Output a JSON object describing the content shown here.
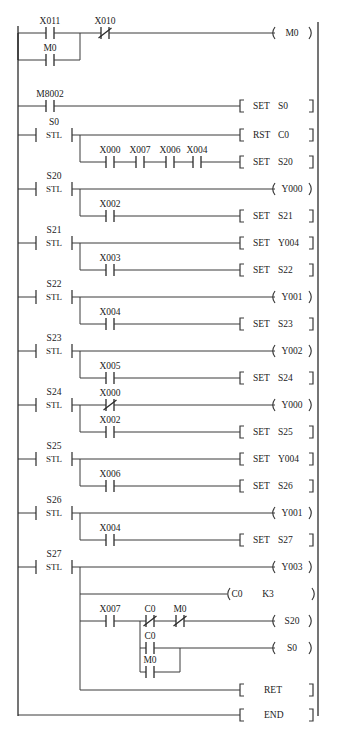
{
  "diagram": {
    "type": "ladder-diagram",
    "left_rail_x": 18,
    "right_rail_x": 318,
    "instructions": {
      "stl": "STL",
      "set": "SET",
      "rst": "RST",
      "ret": "RET",
      "end": "END"
    },
    "rungs": [
      {
        "id": "rung-1",
        "step": null,
        "contacts": [
          {
            "name": "X011",
            "type": "no"
          },
          {
            "name": "M0",
            "type": "no",
            "branch": "parallel"
          },
          {
            "name": "X010",
            "type": "nc"
          }
        ],
        "output": {
          "kind": "coil",
          "label": "M0"
        }
      },
      {
        "id": "rung-2",
        "step": null,
        "contacts": [
          {
            "name": "M8002",
            "type": "no"
          }
        ],
        "output": {
          "kind": "box",
          "instruction": "SET",
          "operand": "S0"
        }
      },
      {
        "id": "rung-3",
        "step": "S0",
        "lines": [
          {
            "contacts": [],
            "output": {
              "kind": "box",
              "instruction": "RST",
              "operand": "C0"
            }
          },
          {
            "contacts": [
              {
                "name": "X000",
                "type": "no"
              },
              {
                "name": "X007",
                "type": "no"
              },
              {
                "name": "X006",
                "type": "no"
              },
              {
                "name": "X004",
                "type": "no"
              }
            ],
            "output": {
              "kind": "box",
              "instruction": "SET",
              "operand": "S20"
            }
          }
        ]
      },
      {
        "id": "rung-4",
        "step": "S20",
        "lines": [
          {
            "contacts": [],
            "output": {
              "kind": "coil",
              "label": "Y000"
            }
          },
          {
            "contacts": [
              {
                "name": "X002",
                "type": "no"
              }
            ],
            "output": {
              "kind": "box",
              "instruction": "SET",
              "operand": "S21"
            }
          }
        ]
      },
      {
        "id": "rung-5",
        "step": "S21",
        "lines": [
          {
            "contacts": [],
            "output": {
              "kind": "box",
              "instruction": "SET",
              "operand": "Y004"
            }
          },
          {
            "contacts": [
              {
                "name": "X003",
                "type": "no"
              }
            ],
            "output": {
              "kind": "box",
              "instruction": "SET",
              "operand": "S22"
            }
          }
        ]
      },
      {
        "id": "rung-6",
        "step": "S22",
        "lines": [
          {
            "contacts": [],
            "output": {
              "kind": "coil",
              "label": "Y001"
            }
          },
          {
            "contacts": [
              {
                "name": "X004",
                "type": "no"
              }
            ],
            "output": {
              "kind": "box",
              "instruction": "SET",
              "operand": "S23"
            }
          }
        ]
      },
      {
        "id": "rung-7",
        "step": "S23",
        "lines": [
          {
            "contacts": [],
            "output": {
              "kind": "coil",
              "label": "Y002"
            }
          },
          {
            "contacts": [
              {
                "name": "X005",
                "type": "no"
              }
            ],
            "output": {
              "kind": "box",
              "instruction": "SET",
              "operand": "S24"
            }
          }
        ]
      },
      {
        "id": "rung-8",
        "step": "S24",
        "lines": [
          {
            "contacts": [
              {
                "name": "X000",
                "type": "nc"
              }
            ],
            "output": {
              "kind": "coil",
              "label": "Y000"
            }
          },
          {
            "contacts": [
              {
                "name": "X002",
                "type": "no"
              }
            ],
            "output": {
              "kind": "box",
              "instruction": "SET",
              "operand": "S25"
            }
          }
        ]
      },
      {
        "id": "rung-9",
        "step": "S25",
        "lines": [
          {
            "contacts": [],
            "output": {
              "kind": "box",
              "instruction": "SET",
              "operand": "Y004"
            }
          },
          {
            "contacts": [
              {
                "name": "X006",
                "type": "no"
              }
            ],
            "output": {
              "kind": "box",
              "instruction": "SET",
              "operand": "S26"
            }
          }
        ]
      },
      {
        "id": "rung-10",
        "step": "S26",
        "lines": [
          {
            "contacts": [],
            "output": {
              "kind": "coil",
              "label": "Y001"
            }
          },
          {
            "contacts": [
              {
                "name": "X004",
                "type": "no"
              }
            ],
            "output": {
              "kind": "box",
              "instruction": "SET",
              "operand": "S27"
            }
          }
        ]
      },
      {
        "id": "rung-11",
        "step": "S27",
        "lines": [
          {
            "contacts": [],
            "output": {
              "kind": "coil",
              "label": "Y003"
            }
          },
          {
            "contacts": [],
            "output": {
              "kind": "counter",
              "label": "C0",
              "preset": "K3"
            }
          },
          {
            "contacts": [
              {
                "name": "X007",
                "type": "no"
              },
              {
                "name": "C0",
                "type": "nc"
              },
              {
                "name": "M0",
                "type": "nc"
              }
            ],
            "output": {
              "kind": "coil",
              "label": "S20"
            }
          },
          {
            "contacts": [
              {
                "name": "C0",
                "type": "no"
              },
              {
                "name": "M0",
                "type": "no",
                "branch": "parallel"
              }
            ],
            "output": {
              "kind": "coil",
              "label": "S0"
            }
          }
        ]
      },
      {
        "id": "rung-12",
        "step": null,
        "contacts": [],
        "output": {
          "kind": "box",
          "instruction": "RET",
          "operand": ""
        }
      },
      {
        "id": "rung-13",
        "step": null,
        "contacts": [],
        "output": {
          "kind": "box",
          "instruction": "END",
          "operand": ""
        }
      }
    ],
    "labels": {
      "X011": "X011",
      "X010": "X010",
      "X000": "X000",
      "X002": "X002",
      "X003": "X003",
      "X004": "X004",
      "X005": "X005",
      "X006": "X006",
      "X007": "X007",
      "M0": "M0",
      "M8002": "M8002",
      "S0": "S0",
      "S20": "S20",
      "S21": "S21",
      "S22": "S22",
      "S23": "S23",
      "S24": "S24",
      "S25": "S25",
      "S26": "S26",
      "S27": "S27",
      "Y000": "Y000",
      "Y001": "Y001",
      "Y002": "Y002",
      "Y003": "Y003",
      "Y004": "Y004",
      "C0": "C0",
      "K3": "K3"
    }
  }
}
